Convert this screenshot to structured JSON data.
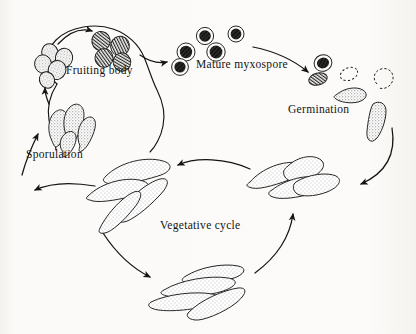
{
  "figure": {
    "background_color": "#fbfaf8",
    "ink_color": "#141414",
    "labels": {
      "fruiting_body": "Fruiting body",
      "mature_myxospore": "Mature myxospore",
      "germination": "Germination",
      "sporulation": "Sporulation",
      "vegetative_cycle": "Vegetative cycle"
    },
    "stages": [
      {
        "name": "fruiting-body",
        "label": "Fruiting body",
        "position": "top-left"
      },
      {
        "name": "mature-myxospore",
        "label": "Mature myxospore",
        "position": "top-center"
      },
      {
        "name": "germination",
        "label": "Germination",
        "position": "right"
      },
      {
        "name": "vegetative-cycle",
        "label": "Vegetative cycle",
        "position": "bottom-center"
      },
      {
        "name": "sporulation",
        "label": "Sporulation",
        "position": "left"
      }
    ],
    "cycle_direction": "counterclockwise",
    "elements": {
      "fruiting_body_blob": "irregular rounded mound enclosing myxospores",
      "myxospores_in_fruiting_body": 4,
      "young_spores_left": 5,
      "mature_myxospores": 5,
      "germination_series": [
        "dark spore",
        "shrinking spore",
        "dashed empty coat",
        "emerging rod",
        "short rod",
        "elongated rod"
      ],
      "sporulation_rods": 4,
      "vegetative_rod_clusters": 3,
      "arrows": 7
    }
  }
}
